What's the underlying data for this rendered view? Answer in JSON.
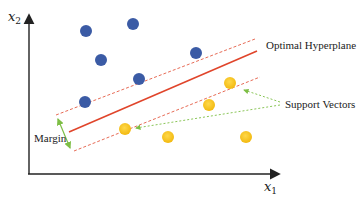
{
  "diagram": {
    "axes": {
      "y_label": "x",
      "y_label_sub": "2",
      "x_label": "x",
      "x_label_sub": "1"
    },
    "labels": {
      "hyperplane": "Optimal Hyperplane",
      "support_vectors": "Support Vectors",
      "margin": "Margin"
    },
    "colors": {
      "class_a": "#3B5BA5",
      "class_b": "#F5C518",
      "hyperplane": "#E0452B",
      "margin_lines": "#E0452B",
      "arrows": "#7DBE45",
      "axis": "#222222"
    },
    "class_a_points": 6,
    "class_b_points": 6,
    "support_vectors": 2
  }
}
